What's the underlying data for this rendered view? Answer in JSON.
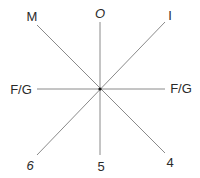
{
  "diagram": {
    "center": {
      "x": 100,
      "y": 89
    },
    "line_color": "#8a8a8a",
    "center_dot_color": "#111111",
    "labels": {
      "top_left": "M",
      "top": "O",
      "top_right": "I",
      "left": "F/G",
      "right": "F/G",
      "bottom_left": "6",
      "bottom": "5",
      "bottom_right": "4"
    }
  }
}
